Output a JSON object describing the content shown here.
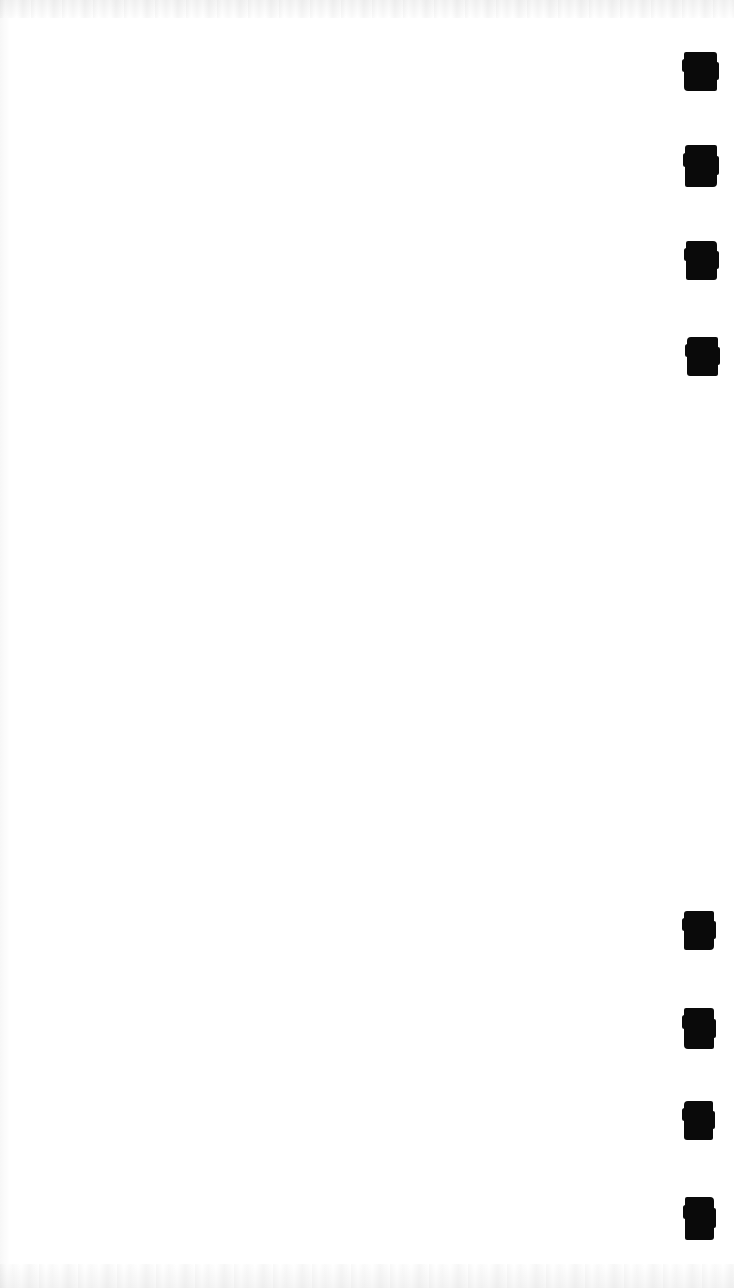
{
  "page": {
    "kind": "scanned-document-page",
    "width": 734,
    "height": 1288,
    "background_color": "#ffffff",
    "ink_color": "#0a0a0a",
    "visible_text": "",
    "note": "Blank scanned page; only heavy black redaction/ink marks are visible."
  },
  "marks": {
    "total_count": 8,
    "alignment": "right-aligned single column",
    "groups": [
      {
        "name": "upper-group",
        "count": 4
      },
      {
        "name": "lower-group",
        "count": 4
      }
    ],
    "items": [
      {
        "id": "mark-1",
        "group": "upper-group",
        "index": 1,
        "x": 684,
        "y": 52,
        "width": 33,
        "height": 39,
        "variant": "v1"
      },
      {
        "id": "mark-2",
        "group": "upper-group",
        "index": 2,
        "x": 685,
        "y": 145,
        "width": 32,
        "height": 42,
        "variant": "v2"
      },
      {
        "id": "mark-3",
        "group": "upper-group",
        "index": 3,
        "x": 686,
        "y": 241,
        "width": 31,
        "height": 39,
        "variant": "v3"
      },
      {
        "id": "mark-4",
        "group": "upper-group",
        "index": 4,
        "x": 687,
        "y": 337,
        "width": 31,
        "height": 39,
        "variant": "v4"
      },
      {
        "id": "mark-5",
        "group": "lower-group",
        "index": 1,
        "x": 684,
        "y": 911,
        "width": 30,
        "height": 39,
        "variant": "v2"
      },
      {
        "id": "mark-6",
        "group": "lower-group",
        "index": 2,
        "x": 684,
        "y": 1008,
        "width": 30,
        "height": 41,
        "variant": "v1"
      },
      {
        "id": "mark-7",
        "group": "lower-group",
        "index": 3,
        "x": 684,
        "y": 1101,
        "width": 29,
        "height": 39,
        "variant": "v4"
      },
      {
        "id": "mark-8",
        "group": "lower-group",
        "index": 4,
        "x": 685,
        "y": 1197,
        "width": 29,
        "height": 43,
        "variant": "v3"
      }
    ]
  }
}
